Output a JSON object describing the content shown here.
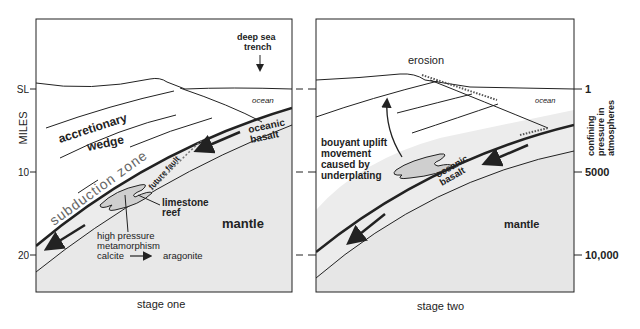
{
  "left_axis": {
    "title": "MILES",
    "ticks": [
      {
        "label": "SL",
        "y": 89
      },
      {
        "label": "10",
        "y": 172
      },
      {
        "label": "20",
        "y": 255
      }
    ]
  },
  "right_axis": {
    "title_lines": [
      "confining",
      "pressure in",
      "atmospheres"
    ],
    "ticks": [
      {
        "label": "1",
        "y": 89
      },
      {
        "label": "5000",
        "y": 172
      },
      {
        "label": "10,000",
        "y": 255
      }
    ]
  },
  "stage_one": {
    "caption": "stage one",
    "labels": {
      "trench_line1": "deep sea",
      "trench_line2": "trench",
      "ocean": "ocean",
      "wedge_line1": "accretionary",
      "wedge_line2": "wedge",
      "basalt_line1": "oceanic",
      "basalt_line2": "basalt",
      "subduction": "subduction zone",
      "fault": "future fault",
      "reef_line1": "limestone",
      "reef_line2": "reef",
      "mantle": "mantle",
      "meta_line1": "high pressure",
      "meta_line2": "metamorphism",
      "meta_from": "calcite",
      "meta_to": "aragonite"
    }
  },
  "stage_two": {
    "caption": "stage two",
    "labels": {
      "erosion": "erosion",
      "ocean": "ocean",
      "uplift_line1": "bouyant uplift",
      "uplift_line2": "movement",
      "uplift_line3": "caused by",
      "uplift_line4": "underplating",
      "basalt_line1": "oceanic",
      "basalt_line2": "basalt",
      "mantle": "mantle"
    }
  },
  "colors": {
    "ink": "#222222",
    "mantle_fill": "#e6e6e6",
    "reef_fill": "#c8c8c8",
    "background": "#ffffff"
  }
}
